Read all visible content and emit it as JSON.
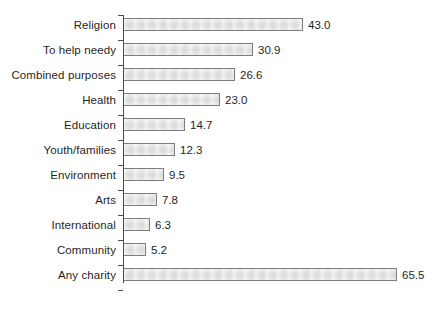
{
  "chart_data": {
    "type": "bar",
    "orientation": "horizontal",
    "title": "",
    "subtitle": "",
    "xlabel": "",
    "ylabel": "",
    "xlim": [
      0,
      65.5
    ],
    "ylim": null,
    "grid": false,
    "legend": null,
    "axis_ticks_visible": true,
    "value_labels_shown": true,
    "categories": [
      "Religion",
      "To help needy",
      "Combined purposes",
      "Health",
      "Education",
      "Youth/families",
      "Environment",
      "Arts",
      "International",
      "Community",
      "Any charity"
    ],
    "values": [
      43.0,
      30.9,
      26.6,
      23.0,
      14.7,
      12.3,
      9.5,
      7.8,
      6.3,
      5.2,
      65.5
    ],
    "value_labels": [
      "43.0",
      "30.9",
      "26.6",
      "23.0",
      "14.7",
      "12.3",
      "9.5",
      "7.8",
      "6.3",
      "5.2",
      "65.5"
    ],
    "bar_fill_color": "#e3e3e3",
    "bar_border_color": "#7d7d7d",
    "axis_color": "#4d4d4d",
    "text_color": "#1f1f1f",
    "background_color": "#ffffff"
  },
  "rows": [
    {
      "label": "Religion",
      "value": 43.0,
      "value_label": "43.0"
    },
    {
      "label": "To help needy",
      "value": 30.9,
      "value_label": "30.9"
    },
    {
      "label": "Combined purposes",
      "value": 26.6,
      "value_label": "26.6"
    },
    {
      "label": "Health",
      "value": 23.0,
      "value_label": "23.0"
    },
    {
      "label": "Education",
      "value": 14.7,
      "value_label": "14.7"
    },
    {
      "label": "Youth/families",
      "value": 12.3,
      "value_label": "12.3"
    },
    {
      "label": "Environment",
      "value": 9.5,
      "value_label": "9.5"
    },
    {
      "label": "Arts",
      "value": 7.8,
      "value_label": "7.8"
    },
    {
      "label": "International",
      "value": 6.3,
      "value_label": "6.3"
    },
    {
      "label": "Community",
      "value": 5.2,
      "value_label": "5.2"
    },
    {
      "label": "Any charity",
      "value": 65.5,
      "value_label": "65.5"
    }
  ]
}
